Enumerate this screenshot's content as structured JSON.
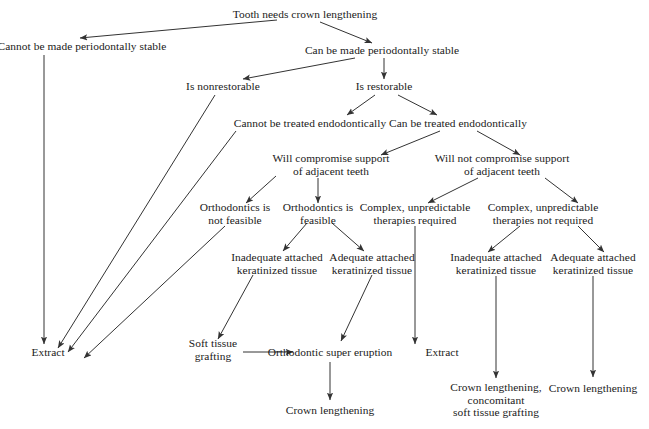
{
  "diagram": {
    "line_color": "#333333",
    "text_color": "#1a1a1a",
    "background": "#ffffff",
    "width": 649,
    "height": 429,
    "nodes": [
      {
        "id": "root",
        "lines": [
          "Tooth needs crown lengthening"
        ],
        "x": 305,
        "y": 14
      },
      {
        "id": "not_perio",
        "lines": [
          "Cannot be made periodontally stable"
        ],
        "x": 82,
        "y": 46
      },
      {
        "id": "can_perio",
        "lines": [
          "Can be made periodontally stable"
        ],
        "x": 382,
        "y": 50
      },
      {
        "id": "nonrestorable",
        "lines": [
          "Is nonrestorable"
        ],
        "x": 223,
        "y": 86
      },
      {
        "id": "restorable",
        "lines": [
          "Is restorable"
        ],
        "x": 384,
        "y": 86
      },
      {
        "id": "cannot_endo",
        "lines": [
          "Cannot be treated endodontically"
        ],
        "x": 310,
        "y": 123
      },
      {
        "id": "can_endo",
        "lines": [
          "Can be treated endodontically"
        ],
        "x": 458,
        "y": 123
      },
      {
        "id": "will_comp",
        "lines": [
          "Will compromise support",
          "of adjacent teeth"
        ],
        "x": 331,
        "y": 165
      },
      {
        "id": "will_not_comp",
        "lines": [
          "Will not compromise support",
          "of adjacent teeth"
        ],
        "x": 502,
        "y": 165
      },
      {
        "id": "ortho_no",
        "lines": [
          "Orthodontics is",
          "not feasible"
        ],
        "x": 235,
        "y": 214
      },
      {
        "id": "ortho_yes",
        "lines": [
          "Orthodontics is",
          "feasible"
        ],
        "x": 318,
        "y": 214
      },
      {
        "id": "complex_req",
        "lines": [
          "Complex, unpredictable",
          "therapies required"
        ],
        "x": 415,
        "y": 214
      },
      {
        "id": "complex_not_req",
        "lines": [
          "Complex, unpredictable",
          "therapies not required"
        ],
        "x": 543,
        "y": 214
      },
      {
        "id": "inad_kt_left",
        "lines": [
          "Inadequate attached",
          "keratinized tissue"
        ],
        "x": 277,
        "y": 264
      },
      {
        "id": "adeq_kt_left",
        "lines": [
          "Adequate attached",
          "keratinized tissue"
        ],
        "x": 372,
        "y": 264
      },
      {
        "id": "inad_kt_right",
        "lines": [
          "Inadequate attached",
          "keratinized tissue"
        ],
        "x": 496,
        "y": 264
      },
      {
        "id": "adeq_kt_right",
        "lines": [
          "Adequate attached",
          "keratinized tissue"
        ],
        "x": 593,
        "y": 264
      },
      {
        "id": "extract_left",
        "lines": [
          "Extract"
        ],
        "x": 48,
        "y": 352
      },
      {
        "id": "soft_graft",
        "lines": [
          "Soft tissue",
          "grafting"
        ],
        "x": 213,
        "y": 350
      },
      {
        "id": "ortho_super",
        "lines": [
          "Orthodontic super eruption"
        ],
        "x": 330,
        "y": 352
      },
      {
        "id": "extract_mid",
        "lines": [
          "Extract"
        ],
        "x": 442,
        "y": 352
      },
      {
        "id": "crown_left",
        "lines": [
          "Crown lengthening"
        ],
        "x": 330,
        "y": 410
      },
      {
        "id": "crown_concom",
        "lines": [
          "Crown lengthening,",
          "concomitant",
          "soft tissue grafting"
        ],
        "x": 496,
        "y": 400
      },
      {
        "id": "crown_right",
        "lines": [
          "Crown lengthening"
        ],
        "x": 593,
        "y": 388
      }
    ],
    "edges": [
      {
        "from": "root",
        "to": "not_perio",
        "style": "diagonal"
      },
      {
        "from": "root",
        "to": "can_perio",
        "style": "diagonal"
      },
      {
        "from": "not_perio",
        "to": "extract_left",
        "style": "vertical"
      },
      {
        "from": "can_perio",
        "to": "nonrestorable",
        "style": "diagonal"
      },
      {
        "from": "can_perio",
        "to": "restorable",
        "style": "vertical"
      },
      {
        "from": "nonrestorable",
        "to": "extract_left",
        "style": "long-diagonal"
      },
      {
        "from": "restorable",
        "to": "cannot_endo",
        "style": "diagonal"
      },
      {
        "from": "restorable",
        "to": "can_endo",
        "style": "diagonal"
      },
      {
        "from": "cannot_endo",
        "to": "extract_left",
        "style": "long-diagonal"
      },
      {
        "from": "can_endo",
        "to": "will_comp",
        "style": "diagonal"
      },
      {
        "from": "can_endo",
        "to": "will_not_comp",
        "style": "diagonal"
      },
      {
        "from": "will_comp",
        "to": "ortho_no",
        "style": "diagonal"
      },
      {
        "from": "will_comp",
        "to": "ortho_yes",
        "style": "vertical"
      },
      {
        "from": "ortho_no",
        "to": "extract_left",
        "style": "long-diagonal"
      },
      {
        "from": "ortho_yes",
        "to": "inad_kt_left",
        "style": "diagonal"
      },
      {
        "from": "ortho_yes",
        "to": "adeq_kt_left",
        "style": "diagonal"
      },
      {
        "from": "inad_kt_left",
        "to": "soft_graft",
        "style": "diagonal"
      },
      {
        "from": "soft_graft",
        "to": "ortho_super",
        "style": "horizontal"
      },
      {
        "from": "adeq_kt_left",
        "to": "ortho_super",
        "style": "diagonal"
      },
      {
        "from": "ortho_super",
        "to": "crown_left",
        "style": "vertical"
      },
      {
        "from": "will_not_comp",
        "to": "complex_req",
        "style": "diagonal"
      },
      {
        "from": "will_not_comp",
        "to": "complex_not_req",
        "style": "diagonal"
      },
      {
        "from": "complex_req",
        "to": "extract_mid",
        "style": "vertical"
      },
      {
        "from": "complex_not_req",
        "to": "inad_kt_right",
        "style": "diagonal"
      },
      {
        "from": "complex_not_req",
        "to": "adeq_kt_right",
        "style": "diagonal"
      },
      {
        "from": "inad_kt_right",
        "to": "crown_concom",
        "style": "vertical"
      },
      {
        "from": "adeq_kt_right",
        "to": "crown_right",
        "style": "vertical"
      }
    ],
    "arrow_paths": [
      {
        "id": "e-root-notperio",
        "d": "M 277 20 L 80 38",
        "arrow": true
      },
      {
        "id": "e-root-canperio",
        "d": "M 320 22 L 372 43",
        "arrow": true
      },
      {
        "id": "e-notperio-extract",
        "d": "M 44 55 L 44 344",
        "arrow": true
      },
      {
        "id": "e-canperio-nonrest",
        "d": "M 355 58 L 243 79",
        "arrow": true
      },
      {
        "id": "e-canperio-restor",
        "d": "M 384 58 L 384 79",
        "arrow": true
      },
      {
        "id": "e-nonrest-extract",
        "d": "M 215 95 L 58 348",
        "arrow": true
      },
      {
        "id": "e-restor-cannotendo",
        "d": "M 375 95 L 347 115",
        "arrow": true
      },
      {
        "id": "e-restor-canendo",
        "d": "M 398 95 L 437 115",
        "arrow": true
      },
      {
        "id": "e-cannotendo-extract",
        "d": "M 236 131 L 68 352",
        "arrow": true
      },
      {
        "id": "e-canendo-willcomp",
        "d": "M 440 131 L 381 155",
        "arrow": true
      },
      {
        "id": "e-canendo-willnot",
        "d": "M 477 131 L 520 155",
        "arrow": true
      },
      {
        "id": "e-willcomp-orthono",
        "d": "M 276 176 L 246 203",
        "arrow": true
      },
      {
        "id": "e-willcomp-orthoyes",
        "d": "M 318 178 L 318 203",
        "arrow": true
      },
      {
        "id": "e-orthono-extract",
        "d": "M 225 226 L 84 358",
        "arrow": true
      },
      {
        "id": "e-orthoyes-inadkt",
        "d": "M 307 223 L 283 251",
        "arrow": true
      },
      {
        "id": "e-orthoyes-adeqkt",
        "d": "M 332 223 L 364 251",
        "arrow": true
      },
      {
        "id": "e-inadkt-soft",
        "d": "M 253 275 L 218 339",
        "arrow": true
      },
      {
        "id": "e-soft-ortho",
        "d": "M 243 352 L 293 352",
        "arrow": true
      },
      {
        "id": "e-adeqkt-ortho",
        "d": "M 372 275 L 341 341",
        "arrow": true
      },
      {
        "id": "e-ortho-crown",
        "d": "M 330 362 L 330 400",
        "arrow": true
      },
      {
        "id": "e-willnot-complexreq",
        "d": "M 478 178 L 428 203",
        "arrow": true
      },
      {
        "id": "e-willnot-complexnot",
        "d": "M 545 178 L 578 203",
        "arrow": true
      },
      {
        "id": "e-complexreq-extract",
        "d": "M 415 226 L 415 344",
        "arrow": true
      },
      {
        "id": "e-complexnot-inadkt",
        "d": "M 520 226 L 488 252",
        "arrow": true
      },
      {
        "id": "e-complexnot-adeqkt",
        "d": "M 578 226 L 604 252",
        "arrow": true
      },
      {
        "id": "e-inadkt-crownconc",
        "d": "M 496 276 L 496 378",
        "arrow": true
      },
      {
        "id": "e-adeqkt-crownright",
        "d": "M 593 276 L 593 377",
        "arrow": true
      }
    ]
  }
}
